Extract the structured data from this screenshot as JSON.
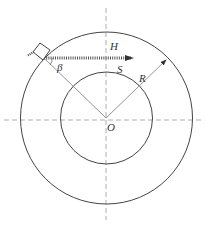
{
  "diagram": {
    "labels": {
      "H": "H",
      "S": "S",
      "beta": "β",
      "R": "R",
      "O": "O"
    },
    "colors": {
      "line": "#444444",
      "dashed": "#999999",
      "ray": "#555555"
    }
  }
}
